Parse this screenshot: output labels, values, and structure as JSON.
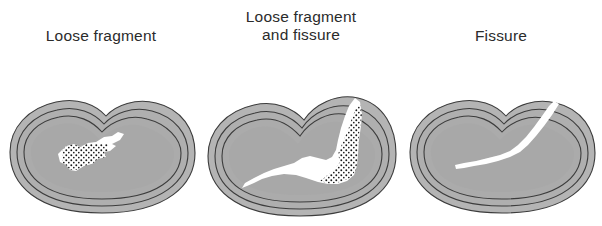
{
  "figure": {
    "width": 602,
    "height": 226,
    "background_color": "#ffffff"
  },
  "style": {
    "bone_fill": "#a8a8a8",
    "cortex_fill": "#b4b4b4",
    "outline_color": "#3c3c3c",
    "lesion_fill": "#ffffff",
    "stipple_color": "#1a1a1a",
    "caption_color": "#2b2b2b"
  },
  "panels": [
    {
      "id": "loose-fragment",
      "caption": "Loose fragment",
      "lesion_type": "loose fragment",
      "has_stipple": true,
      "has_fissure": false,
      "fissure_reaches_surface": false,
      "description": "Intact overlying surface with an enclosed stippled loose fragment in the subchondral bone"
    },
    {
      "id": "loose-fragment-and-fissure",
      "caption": "Loose fragment\nand fissure",
      "lesion_type": "loose fragment and fissure",
      "has_stipple": true,
      "has_fissure": true,
      "fissure_reaches_surface": true,
      "description": "Stippled loose fragment with a fissure tracking to the articular surface"
    },
    {
      "id": "fissure",
      "caption": "Fissure",
      "lesion_type": "fissure",
      "has_stipple": false,
      "has_fissure": true,
      "fissure_reaches_surface": true,
      "description": "Linear fissure extending from the articular surface into the bone, no loose fragment"
    }
  ]
}
